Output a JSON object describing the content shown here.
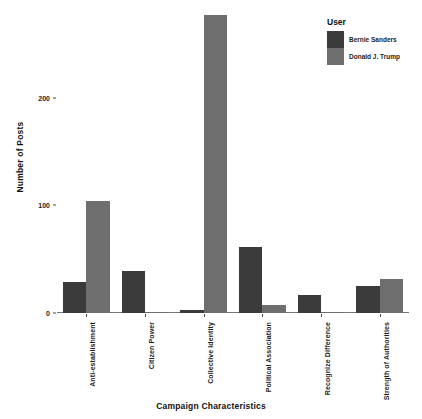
{
  "chart_data": {
    "type": "bar",
    "title": "",
    "xlabel": "Campaign Characteristics",
    "ylabel": "Number of Posts",
    "categories": [
      "Anti-establishment",
      "Citizen Power",
      "Collective Identity",
      "Political Association",
      "Recognize Difference",
      "Strength of Authorities"
    ],
    "series": [
      {
        "name": "Bernie Sanders",
        "color": "#3b3b3b",
        "values": [
          29,
          39,
          3,
          61,
          17,
          25
        ]
      },
      {
        "name": "Donald J. Trump",
        "color": "#6e6e6e",
        "values": [
          104,
          1,
          277,
          7,
          1,
          32
        ]
      }
    ],
    "ylim": [
      0,
      285
    ],
    "yticks": [
      0,
      100,
      200
    ],
    "ytick_labels": [
      "0",
      "100",
      "200"
    ],
    "grid": false,
    "legend_position": "top-right"
  },
  "legend": {
    "title": "User",
    "entries": [
      {
        "label": "Bernie Sanders",
        "color": "#3b3b3b"
      },
      {
        "label": "Donald J. Trump",
        "color": "#6e6e6e"
      }
    ]
  },
  "axes": {
    "y_title": "Number of Posts",
    "x_title": "Campaign Characteristics"
  }
}
